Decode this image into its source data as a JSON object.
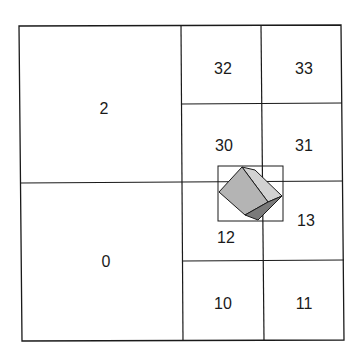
{
  "diagram": {
    "type": "quadtree-subdivision",
    "cells": [
      {
        "label": "2",
        "x": 20,
        "y": 26,
        "w": 162,
        "h": 156
      },
      {
        "label": "0",
        "x": 21,
        "y": 182,
        "w": 162,
        "h": 158
      },
      {
        "label": "32",
        "x": 181,
        "y": 26,
        "w": 80,
        "h": 78
      },
      {
        "label": "33",
        "x": 261,
        "y": 26,
        "w": 81,
        "h": 78
      },
      {
        "label": "30",
        "x": 181,
        "y": 104,
        "w": 81,
        "h": 78
      },
      {
        "label": "31",
        "x": 262,
        "y": 104,
        "w": 80,
        "h": 78
      },
      {
        "label": "12",
        "x": 182,
        "y": 182,
        "w": 81,
        "h": 78
      },
      {
        "label": "13",
        "x": 263,
        "y": 182,
        "w": 80,
        "h": 78
      },
      {
        "label": "10",
        "x": 183,
        "y": 260,
        "w": 81,
        "h": 80
      },
      {
        "label": "11",
        "x": 264,
        "y": 260,
        "w": 80,
        "h": 80
      }
    ],
    "labels": {
      "l2": "2",
      "l0": "0",
      "l32": "32",
      "l33": "33",
      "l30": "30",
      "l31": "31",
      "l12": "12",
      "l13": "13",
      "l10": "10",
      "l11": "11"
    },
    "object": {
      "shape": "rotated-cube",
      "bounding_box": {
        "x": 218,
        "y": 166,
        "w": 65,
        "h": 55
      }
    },
    "colors": {
      "line": "#1a1a1a",
      "cube_front": "#b4b4b4",
      "cube_top": "#d2d2d2",
      "cube_side": "#7a7a7a"
    }
  }
}
